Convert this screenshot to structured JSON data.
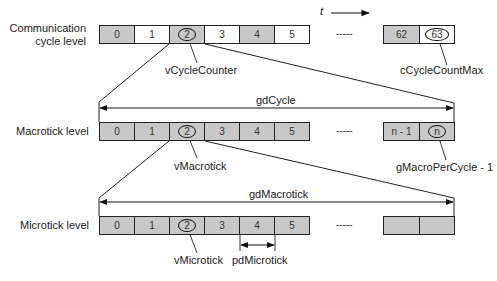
{
  "diagram": {
    "time_axis_label": "t",
    "ellipsis": "-----",
    "levels": [
      {
        "label_line1": "Communication",
        "label_line2": "cycle level",
        "cells_left": [
          {
            "text": "0",
            "fill": "gray"
          },
          {
            "text": "1",
            "fill": "white"
          },
          {
            "text": "2",
            "fill": "gray",
            "circled": true
          },
          {
            "text": "3",
            "fill": "white"
          },
          {
            "text": "4",
            "fill": "gray"
          },
          {
            "text": "5",
            "fill": "white"
          }
        ],
        "cells_right": [
          {
            "text": "62",
            "fill": "gray"
          },
          {
            "text": "63",
            "fill": "white",
            "circled": true
          }
        ],
        "callout_left": "vCycleCounter",
        "callout_right": "cCycleCountMax"
      },
      {
        "label": "Macrotick level",
        "span_label": "gdCycle",
        "cells_left": [
          {
            "text": "0",
            "fill": "gray"
          },
          {
            "text": "1",
            "fill": "gray"
          },
          {
            "text": "2",
            "fill": "gray",
            "circled": true
          },
          {
            "text": "3",
            "fill": "gray"
          },
          {
            "text": "4",
            "fill": "gray"
          },
          {
            "text": "5",
            "fill": "gray"
          }
        ],
        "cells_right": [
          {
            "text": "n - 1",
            "fill": "gray"
          },
          {
            "text": "n",
            "fill": "gray",
            "circled": true
          }
        ],
        "callout_left": "vMacrotick",
        "callout_right": "gMacroPerCycle - 1"
      },
      {
        "label": "Microtick level",
        "span_label": "gdMacrotick",
        "cells_left": [
          {
            "text": "0",
            "fill": "gray"
          },
          {
            "text": "1",
            "fill": "gray"
          },
          {
            "text": "2",
            "fill": "gray",
            "circled": true
          },
          {
            "text": "3",
            "fill": "gray"
          },
          {
            "text": "4",
            "fill": "gray"
          },
          {
            "text": "5",
            "fill": "gray"
          }
        ],
        "cells_right": [
          {
            "text": "",
            "fill": "gray"
          },
          {
            "text": "",
            "fill": "gray"
          }
        ],
        "callout_left": "vMicrotick",
        "callout_mid": "pdMicrotick"
      }
    ]
  }
}
